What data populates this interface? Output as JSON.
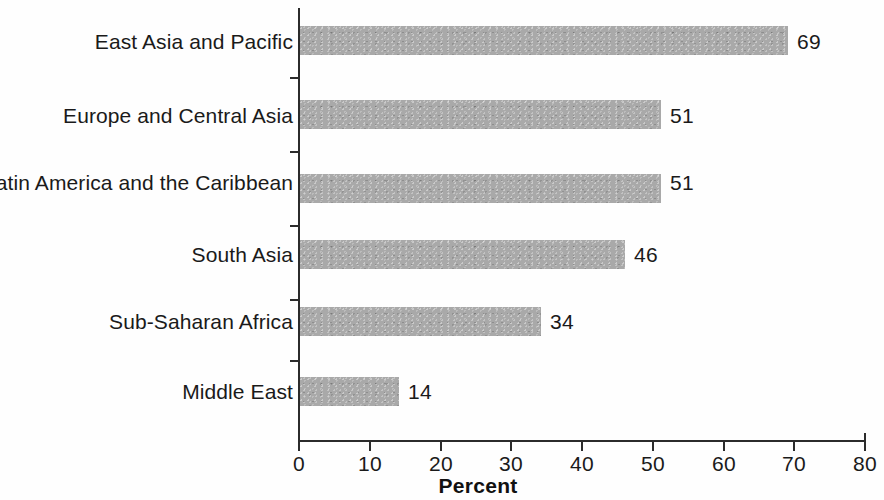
{
  "chart_data": {
    "type": "bar",
    "orientation": "horizontal",
    "title": "",
    "subtitle": "",
    "xlabel": "Percent",
    "ylabel": "",
    "categories": [
      "East Asia and Pacific",
      "Europe and Central Asia",
      "Latin America and the Caribbean",
      "South Asia",
      "Sub-Saharan Africa",
      "Middle East"
    ],
    "values": [
      69,
      51,
      51,
      46,
      34,
      14
    ],
    "value_labels": [
      "69",
      "51",
      "51",
      "46",
      "34",
      "14"
    ],
    "xlim": [
      0,
      80
    ],
    "xticks": [
      0,
      10,
      20,
      30,
      40,
      50,
      60,
      70,
      80
    ],
    "xtick_labels": [
      "0",
      "10",
      "20",
      "30",
      "40",
      "50",
      "60",
      "70",
      "80"
    ],
    "grid": false,
    "legend": null,
    "legend_position": "none",
    "bar_color": "#a9a9a9",
    "axis_color": "#2b2b2b",
    "text_color": "#1a1a1a"
  }
}
